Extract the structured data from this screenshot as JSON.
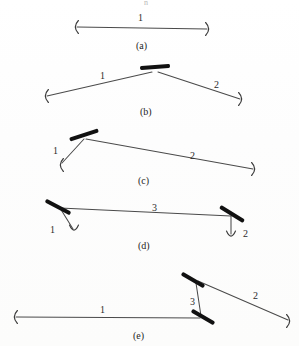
{
  "figure": {
    "artifact_top": "n",
    "colors": {
      "segment_stroke": "#4a4a4a",
      "joint_fill": "#111111",
      "endcap_stroke": "#3c3c3c",
      "label_text": "#2b2b2b",
      "paper": "#ffffff"
    },
    "panels": [
      {
        "id": "a",
        "label": "(a)",
        "label_x": 136,
        "label_y": 41,
        "segments": [
          {
            "name": "1",
            "label": "1",
            "label_x": 138,
            "label_y": 13,
            "x1": 77,
            "y1": 27,
            "x2": 207,
            "y2": 29
          }
        ],
        "joints": [],
        "endcaps": [
          {
            "name": "endcap-left",
            "x": 75,
            "y": 27,
            "dir": "open"
          },
          {
            "name": "endcap-right",
            "x": 209,
            "y": 29,
            "dir": "close"
          }
        ]
      },
      {
        "id": "b",
        "label": "(b)",
        "label_x": 140,
        "label_y": 107,
        "segments": [
          {
            "name": "1",
            "label": "1",
            "label_x": 100,
            "label_y": 71,
            "x1": 47,
            "y1": 96,
            "x2": 152,
            "y2": 72
          },
          {
            "name": "2",
            "label": "2",
            "label_x": 214,
            "label_y": 80,
            "x1": 158,
            "y1": 72,
            "x2": 240,
            "y2": 99
          }
        ],
        "joints": [
          {
            "name": "joint-apex",
            "cx": 155,
            "cy": 67,
            "angle": -4,
            "length": 30,
            "thickness": 4
          }
        ],
        "endcaps": [
          {
            "name": "endcap-left",
            "x": 45,
            "y": 96,
            "dir": "open"
          },
          {
            "name": "endcap-right",
            "x": 242,
            "y": 99,
            "dir": "close"
          }
        ]
      },
      {
        "id": "c",
        "label": "(c)",
        "label_x": 138,
        "label_y": 176,
        "segments": [
          {
            "name": "1",
            "label": "1",
            "label_x": 53,
            "label_y": 146,
            "x1": 62,
            "y1": 163,
            "x2": 84,
            "y2": 139
          },
          {
            "name": "2",
            "label": "2",
            "label_x": 190,
            "label_y": 151,
            "x1": 86,
            "y1": 139,
            "x2": 253,
            "y2": 169
          }
        ],
        "joints": [
          {
            "name": "joint-left",
            "cx": 84,
            "cy": 135,
            "angle": -18,
            "length": 30,
            "thickness": 4
          }
        ],
        "endcaps": [
          {
            "name": "endcap-left",
            "x": 60,
            "y": 165,
            "dir": "open"
          },
          {
            "name": "endcap-right",
            "x": 255,
            "y": 169,
            "dir": "close"
          }
        ]
      },
      {
        "id": "d",
        "label": "(d)",
        "label_x": 138,
        "label_y": 241,
        "segments": [
          {
            "name": "3",
            "label": "3",
            "label_x": 152,
            "label_y": 203,
            "x1": 60,
            "y1": 208,
            "x2": 231,
            "y2": 216
          },
          {
            "name": "1",
            "label": "1",
            "label_x": 50,
            "label_y": 225,
            "x1": 60,
            "y1": 208,
            "x2": 73,
            "y2": 229
          },
          {
            "name": "2",
            "label": "2",
            "label_x": 243,
            "label_y": 229,
            "x1": 231,
            "y1": 216,
            "x2": 231,
            "y2": 234
          }
        ],
        "joints": [
          {
            "name": "joint-left",
            "cx": 58,
            "cy": 207,
            "angle": 28,
            "length": 28,
            "thickness": 4
          },
          {
            "name": "joint-right",
            "cx": 232,
            "cy": 214,
            "angle": 32,
            "length": 28,
            "thickness": 4
          }
        ],
        "endcaps": [
          {
            "name": "endcap-left",
            "x": 74,
            "y": 231,
            "dir": "down"
          },
          {
            "name": "endcap-right",
            "x": 231,
            "y": 237,
            "dir": "down"
          }
        ]
      },
      {
        "id": "e",
        "label": "(e)",
        "label_x": 133,
        "label_y": 331,
        "segments": [
          {
            "name": "1",
            "label": "1",
            "label_x": 100,
            "label_y": 305,
            "x1": 16,
            "y1": 317,
            "x2": 200,
            "y2": 318
          },
          {
            "name": "3",
            "label": "3",
            "label_x": 190,
            "label_y": 297,
            "x1": 196,
            "y1": 283,
            "x2": 201,
            "y2": 316
          },
          {
            "name": "2",
            "label": "2",
            "label_x": 253,
            "label_y": 291,
            "x1": 198,
            "y1": 281,
            "x2": 288,
            "y2": 320
          }
        ],
        "joints": [
          {
            "name": "joint-upper",
            "cx": 193,
            "cy": 280,
            "angle": 30,
            "length": 26,
            "thickness": 4
          },
          {
            "name": "joint-lower",
            "cx": 203,
            "cy": 317,
            "angle": 30,
            "length": 26,
            "thickness": 4
          }
        ],
        "endcaps": [
          {
            "name": "endcap-left",
            "x": 14,
            "y": 317,
            "dir": "open"
          },
          {
            "name": "endcap-right",
            "x": 290,
            "y": 321,
            "dir": "close"
          }
        ]
      }
    ]
  }
}
